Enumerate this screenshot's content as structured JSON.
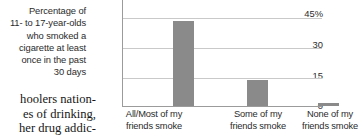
{
  "caption": {
    "lines": [
      "Percentage of",
      "11- to 17-year-olds",
      "who smoked a",
      "cigarette at least",
      "once in the past",
      "30 days"
    ]
  },
  "body_text": {
    "lines": [
      "hoolers nation-",
      "es of drinking,",
      "her drug addic-"
    ]
  },
  "colors": {
    "bar": "#8a8a8a",
    "gridline": "#c9c9c9",
    "axis": "#9b9b9b",
    "text": "#2b2b2b"
  },
  "chart_data": {
    "type": "bar",
    "title": "Percentage of 11- to 17-year-olds who smoked a cigarette at least once in the past 30 days",
    "categories": [
      "All/Most of my friends smoke",
      "Some of my friends smoke",
      "None of my friends smoke"
    ],
    "category_lines": [
      [
        "All/Most of my",
        "friends smoke"
      ],
      [
        "Some of my",
        "friends smoke"
      ],
      [
        "None of my",
        "friends smoke"
      ]
    ],
    "values": [
      43,
      13,
      1.5
    ],
    "xlabel": "",
    "ylabel": "",
    "ylim": [
      0,
      45
    ],
    "yticks": [
      0,
      15,
      30,
      45
    ],
    "ytick_labels": [
      "0",
      "15",
      "30",
      "45%"
    ],
    "grid": true,
    "legend": false
  }
}
